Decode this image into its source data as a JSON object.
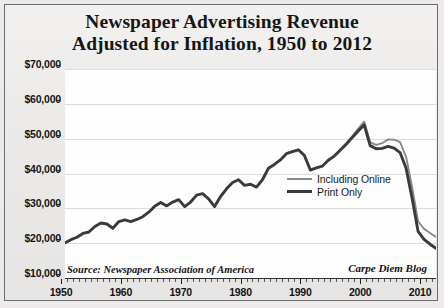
{
  "title": {
    "line1": "Newspaper Advertising Revenue",
    "line2": "Adjusted for Inflation, 1950 to 2012"
  },
  "notes": {
    "axis_note": "Millions of 2012 Dollars",
    "source": "Source: Newspaper Association of America",
    "credit": "Carpe Diem Blog"
  },
  "legend": {
    "items": [
      {
        "label": "Including Online",
        "color": "#8a8a8a",
        "style": "thin"
      },
      {
        "label": "Print Only",
        "color": "#3a3a3a",
        "style": "thick"
      }
    ]
  },
  "axis": {
    "y_ticks": [
      "$70,000",
      "$60,000",
      "$50,000",
      "$40,000",
      "$30,000",
      "$20,000",
      "$10,000"
    ],
    "x_ticks": [
      "1950",
      "1960",
      "1970",
      "1980",
      "1990",
      "2000",
      "2010"
    ]
  },
  "chart_data": {
    "type": "line",
    "title": "Newspaper Advertising Revenue Adjusted for Inflation, 1950 to 2012",
    "xlabel": "",
    "ylabel": "Millions of 2012 Dollars",
    "ylim": [
      10000,
      70000
    ],
    "xlim": [
      1950,
      2012
    ],
    "grid": true,
    "legend_position": "inside-right",
    "source": "Newspaper Association of America",
    "credit": "Carpe Diem Blog",
    "x": [
      1950,
      1951,
      1952,
      1953,
      1954,
      1955,
      1956,
      1957,
      1958,
      1959,
      1960,
      1961,
      1962,
      1963,
      1964,
      1965,
      1966,
      1967,
      1968,
      1969,
      1970,
      1971,
      1972,
      1973,
      1974,
      1975,
      1976,
      1977,
      1978,
      1979,
      1980,
      1981,
      1982,
      1983,
      1984,
      1985,
      1986,
      1987,
      1988,
      1989,
      1990,
      1991,
      1992,
      1993,
      1994,
      1995,
      1996,
      1997,
      1998,
      1999,
      2000,
      2001,
      2002,
      2003,
      2004,
      2005,
      2006,
      2007,
      2008,
      2009,
      2010,
      2011,
      2012
    ],
    "series": [
      {
        "name": "Print Only",
        "color": "#3a3a3a",
        "values": [
          20100,
          21000,
          21700,
          22800,
          23200,
          24800,
          25800,
          25500,
          24300,
          26200,
          26700,
          26200,
          26800,
          27600,
          28900,
          30600,
          31700,
          30700,
          31800,
          32500,
          30500,
          31800,
          33800,
          34200,
          32700,
          30500,
          33400,
          35600,
          37400,
          38200,
          36600,
          36900,
          36100,
          38200,
          41500,
          42600,
          43900,
          45700,
          46300,
          46800,
          45200,
          41000,
          41600,
          42100,
          43800,
          45000,
          46700,
          48400,
          50300,
          52200,
          54000,
          48000,
          47100,
          47200,
          47800,
          47300,
          46000,
          41500,
          33000,
          23400,
          21100,
          19700,
          18500
        ]
      },
      {
        "name": "Including Online",
        "color": "#8a8a8a",
        "values": [
          null,
          null,
          null,
          null,
          null,
          null,
          null,
          null,
          null,
          null,
          null,
          null,
          null,
          null,
          null,
          null,
          null,
          null,
          null,
          null,
          null,
          null,
          null,
          null,
          null,
          null,
          null,
          null,
          null,
          null,
          null,
          null,
          null,
          null,
          null,
          null,
          null,
          null,
          null,
          null,
          null,
          null,
          null,
          null,
          null,
          45100,
          46900,
          48700,
          50700,
          52900,
          54900,
          48900,
          48200,
          48700,
          49800,
          49700,
          49000,
          44800,
          36200,
          26300,
          24100,
          22900,
          21800
        ]
      }
    ],
    "annotations": [
      {
        "text": "Peak ~$54,000 in 2000 (print)",
        "year": 2000
      },
      {
        "text": "Collapse to ~$18,500 by 2012 (print)",
        "year": 2012
      }
    ]
  }
}
